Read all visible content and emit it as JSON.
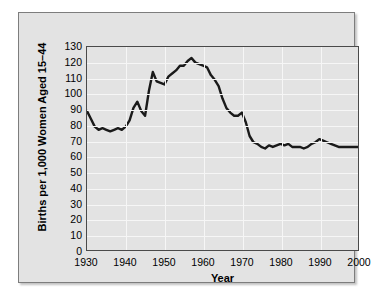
{
  "chart_data": {
    "type": "line",
    "title": "",
    "subtitle": "",
    "xlabel": "Year",
    "ylabel": "Births per 1,000 Women Aged 15–44",
    "xlim": [
      1930,
      2000
    ],
    "ylim": [
      0,
      130
    ],
    "xticks": [
      1930,
      1940,
      1950,
      1960,
      1970,
      1980,
      1990,
      2000
    ],
    "yticks": [
      0,
      10,
      20,
      30,
      40,
      50,
      60,
      70,
      80,
      90,
      100,
      110,
      120,
      130
    ],
    "grid": true,
    "legend": false,
    "legend_position": "none",
    "line_color": "#1a1a1a",
    "plot_background": "#e3e3e3",
    "gridline_color": "#f6f6f6",
    "series": [
      {
        "name": "Births per 1,000 Women Aged 15-44",
        "x": [
          1930,
          1931,
          1932,
          1933,
          1934,
          1935,
          1936,
          1937,
          1938,
          1939,
          1940,
          1941,
          1942,
          1943,
          1944,
          1945,
          1946,
          1947,
          1948,
          1949,
          1950,
          1951,
          1952,
          1953,
          1954,
          1955,
          1956,
          1957,
          1958,
          1959,
          1960,
          1961,
          1962,
          1963,
          1964,
          1965,
          1966,
          1967,
          1968,
          1969,
          1970,
          1971,
          1972,
          1973,
          1974,
          1975,
          1976,
          1977,
          1978,
          1979,
          1980,
          1981,
          1982,
          1983,
          1984,
          1985,
          1986,
          1987,
          1988,
          1989,
          1990,
          1991,
          1992,
          1993,
          1994,
          1995,
          1996,
          1997,
          1998,
          1999,
          2000
        ],
        "values": [
          89,
          84,
          79,
          77,
          78,
          77,
          76,
          77,
          78,
          77,
          79,
          83,
          91,
          95,
          89,
          86,
          102,
          114,
          108,
          107,
          106,
          111,
          113,
          115,
          118,
          118,
          121,
          123,
          120,
          119,
          118,
          117,
          112,
          109,
          105,
          97,
          91,
          88,
          86,
          86,
          88,
          82,
          73,
          69,
          68,
          66,
          65,
          67,
          66,
          67,
          68,
          67,
          68,
          66,
          66,
          66,
          65,
          66,
          68,
          69,
          71,
          70,
          69,
          68,
          67,
          66,
          66,
          66,
          66,
          66,
          66
        ]
      }
    ]
  },
  "axes": {
    "ylabel": "Births per 1,000 Women Aged 15–44",
    "xlabel": "Year",
    "ytick_labels": [
      "130",
      "120",
      "110",
      "100",
      "90",
      "80",
      "70",
      "60",
      "50",
      "40",
      "30",
      "20",
      "10",
      "0"
    ],
    "xtick_labels": [
      "1930",
      "1940",
      "1950",
      "1960",
      "1970",
      "1980",
      "1990",
      "2000"
    ]
  }
}
